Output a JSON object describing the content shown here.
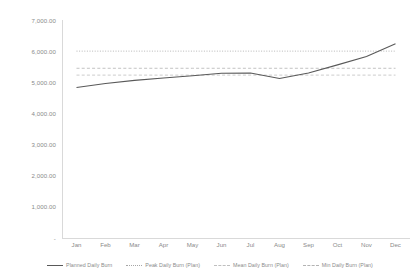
{
  "chart_data": {
    "type": "line",
    "title": "",
    "xlabel": "",
    "ylabel": "",
    "categories": [
      "Jan",
      "Feb",
      "Mar",
      "Apr",
      "May",
      "Jun",
      "Jul",
      "Aug",
      "Sep",
      "Oct",
      "Nov",
      "Dec"
    ],
    "ylim": [
      0,
      7000
    ],
    "ytick_values": [
      0,
      1000,
      2000,
      3000,
      4000,
      5000,
      6000,
      7000
    ],
    "ytick_labels": [
      "-",
      "1,000.00",
      "2,000.00",
      "3,000.00",
      "4,000.00",
      "5,000.00",
      "6,000.00",
      "7,000.00"
    ],
    "grid": false,
    "legend_position": "bottom",
    "series": [
      {
        "name": "Planned Daily Burn",
        "style": "solid",
        "color": "#595959",
        "values": [
          4830,
          4960,
          5060,
          5140,
          5210,
          5290,
          5300,
          5120,
          5300,
          5560,
          5830,
          6240
        ]
      },
      {
        "name": "Peak Daily Burn (Plan)",
        "style": "dotted",
        "color": "#a6a6a6",
        "constant": 6000,
        "values": [
          6000,
          6000,
          6000,
          6000,
          6000,
          6000,
          6000,
          6000,
          6000,
          6000,
          6000,
          6000
        ]
      },
      {
        "name": "Mean Daily Burn (Plan)",
        "style": "dashed",
        "color": "#bfbfbf",
        "constant": 5230,
        "values": [
          5230,
          5230,
          5230,
          5230,
          5230,
          5230,
          5230,
          5230,
          5230,
          5230,
          5230,
          5230
        ]
      },
      {
        "name": "Min Daily Burn (Plan)",
        "style": "dashed",
        "color": "#b3b3b3",
        "constant": 5450,
        "values": [
          5450,
          5450,
          5450,
          5450,
          5450,
          5450,
          5450,
          5450,
          5450,
          5450,
          5450,
          5450
        ]
      }
    ]
  },
  "legend": {
    "items": [
      {
        "label": "Planned Daily Burn",
        "style": "solid",
        "color": "#595959"
      },
      {
        "label": "Peak Daily Burn (Plan)",
        "style": "dotted",
        "color": "#a6a6a6"
      },
      {
        "label": "Mean Daily Burn (Plan)",
        "style": "dashed",
        "color": "#bfbfbf"
      },
      {
        "label": "Min Daily Burn (Plan)",
        "style": "dashed",
        "color": "#b3b3b3"
      }
    ]
  },
  "colors": {
    "axis": "#d9d9d9",
    "text": "#8a8a8a",
    "background": "#ffffff"
  }
}
